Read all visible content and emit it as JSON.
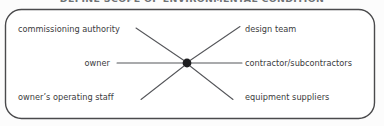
{
  "figure": {
    "title": "DEFINE SCOPE OF ENVIRONMENTAL CONDITION",
    "title_cropped": true,
    "background_color": "#fcfcfc",
    "border_color": "#4a4a4c",
    "line_color": "#55565a",
    "hub_color": "#1e1e20",
    "text_color": "#3b3b3d"
  },
  "diagram": {
    "type": "hub-and-spoke",
    "hub": {
      "name": "central-node",
      "x": 187,
      "y": 63,
      "radius": 4.4
    },
    "spokes": [
      {
        "id": "commissioning-authority",
        "label": "commissioning authority",
        "side": "left",
        "position": "top",
        "line": {
          "x1": 136,
          "y1": 28,
          "x2": 183,
          "y2": 60
        }
      },
      {
        "id": "owner",
        "label": "owner",
        "side": "left",
        "position": "middle",
        "line": {
          "x1": 118,
          "y1": 63,
          "x2": 183,
          "y2": 63
        }
      },
      {
        "id": "owners-operating-staff",
        "label": "owner’s operating staff",
        "side": "left",
        "position": "bottom",
        "line": {
          "x1": 141,
          "y1": 99,
          "x2": 183,
          "y2": 66
        }
      },
      {
        "id": "design-team",
        "label": "design team",
        "side": "right",
        "position": "top",
        "line": {
          "x1": 191,
          "y1": 60,
          "x2": 240,
          "y2": 27
        }
      },
      {
        "id": "contractor-subcontractors",
        "label": "contractor/subcontractors",
        "side": "right",
        "position": "middle",
        "line": {
          "x1": 191,
          "y1": 63,
          "x2": 241,
          "y2": 63
        }
      },
      {
        "id": "equipment-suppliers",
        "label": "equipment suppliers",
        "side": "right",
        "position": "bottom",
        "line": {
          "x1": 191,
          "y1": 66,
          "x2": 233,
          "y2": 99
        }
      }
    ],
    "frame": {
      "name": "rounded-rectangle-frame",
      "x": 5,
      "y": 9,
      "width": 370,
      "height": 110,
      "radius": 16
    }
  }
}
